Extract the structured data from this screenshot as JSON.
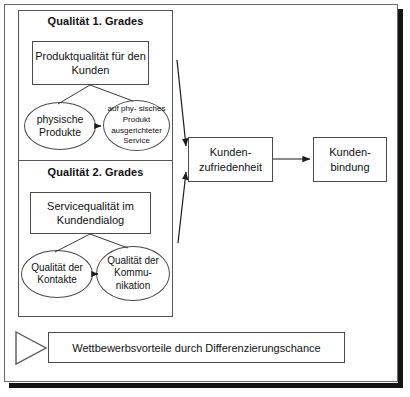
{
  "diagram": {
    "title_grade_1": "Qualität 1. Grades",
    "title_grade_2": "Qualität 2. Grades",
    "box_produktqualitaet": "Produktqualität für den Kunden",
    "box_servicequalitaet": "Servicequalität im Kundendialog",
    "ellipse_physische_produkte": "physische Produkte",
    "ellipse_service": "auf phy- sisches Produkt ausgerichteter Service",
    "ellipse_kontakte": "Qualität der Kontakte",
    "ellipse_kommunikation": "Qualität der Kommu- nikation",
    "box_kundenzufriedenheit": "Kunden- zufriedenheit",
    "box_kundenbindung": "Kunden- bindung",
    "banner_text": "Wettbewerbsvorteile durch Differenzierungschance",
    "colors": {
      "stroke": "#4a4a4a",
      "frame": "#6a6a6a",
      "shadow": "#141414",
      "text": "#111111",
      "background": "#ffffff"
    }
  }
}
